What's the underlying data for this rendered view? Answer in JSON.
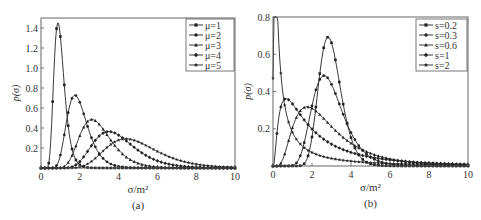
{
  "chart_data": [
    {
      "type": "line",
      "panel_label": "(a)",
      "xlabel": "σ/m²",
      "ylabel": "p(σ)",
      "xlim": [
        0,
        10
      ],
      "ylim": [
        0,
        1.5
      ],
      "xticks": [
        0,
        2,
        4,
        6,
        8,
        10
      ],
      "yticks": [
        0.2,
        0.4,
        0.6,
        0.8,
        1.0,
        1.2,
        1.4
      ],
      "grid": false,
      "legend_position": "upper right",
      "distribution": "lognormal (fixed s = 0.3, varying mean μ)",
      "series": [
        {
          "name": "μ=1",
          "mean": 1,
          "s": 0.3,
          "marker": "square",
          "peak": {
            "x": 0.8,
            "y": 1.39
          }
        },
        {
          "name": "μ=2",
          "mean": 2,
          "s": 0.3,
          "marker": "circle",
          "peak": {
            "x": 1.8,
            "y": 0.69
          }
        },
        {
          "name": "μ=3",
          "mean": 3,
          "s": 0.3,
          "marker": "triangle",
          "peak": {
            "x": 2.7,
            "y": 0.46
          }
        },
        {
          "name": "μ=4",
          "mean": 4,
          "s": 0.3,
          "marker": "diamond",
          "peak": {
            "x": 3.6,
            "y": 0.35
          }
        },
        {
          "name": "μ=5",
          "mean": 5,
          "s": 0.3,
          "marker": "star",
          "peak": {
            "x": 4.5,
            "y": 0.28
          }
        }
      ]
    },
    {
      "type": "line",
      "panel_label": "(b)",
      "xlabel": "σ/m²",
      "ylabel": "p(σ)",
      "xlim": [
        0,
        10
      ],
      "ylim": [
        0,
        0.8
      ],
      "xticks": [
        0,
        2,
        4,
        6,
        8,
        10
      ],
      "yticks": [
        0.2,
        0.4,
        0.6,
        0.8
      ],
      "grid": false,
      "legend_position": "upper right",
      "distribution": "lognormal (fixed mean = 3, varying s)",
      "series": [
        {
          "name": "s=0.2",
          "mean": 3,
          "s": 0.2,
          "marker": "square",
          "peak": {
            "x": 2.8,
            "y": 0.68
          }
        },
        {
          "name": "s=0.3",
          "mean": 3,
          "s": 0.3,
          "marker": "circle",
          "peak": {
            "x": 2.7,
            "y": 0.46
          }
        },
        {
          "name": "s=0.6",
          "mean": 3,
          "s": 0.6,
          "marker": "triangle",
          "peak": {
            "x": 2.1,
            "y": 0.27
          }
        },
        {
          "name": "s=1",
          "mean": 3,
          "s": 1.0,
          "marker": "diamond",
          "peak": {
            "x": 1.1,
            "y": 0.22
          }
        },
        {
          "name": "s=2",
          "mean": 3,
          "s": 2.0,
          "marker": "star",
          "peak": {
            "x": 0.0,
            "y": 0.47
          }
        }
      ]
    }
  ],
  "panels": [
    {
      "caption": "(a)",
      "xlabel": "σ/m²",
      "ylabel_main": "p",
      "ylabel_arg": "(σ)"
    },
    {
      "caption": "(b)",
      "xlabel": "σ/m²",
      "ylabel_main": "p",
      "ylabel_arg": "(σ)"
    }
  ]
}
